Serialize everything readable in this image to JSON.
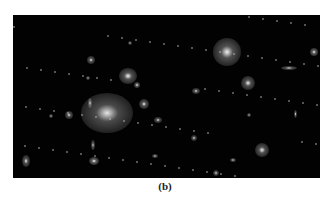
{
  "figure": {
    "caption": "(b)",
    "background_color": "#020202",
    "galaxies": [
      {
        "x": 94,
        "y": 98,
        "rx": 26,
        "ry": 20,
        "a": 0.55
      },
      {
        "x": 214,
        "y": 37,
        "rx": 14,
        "ry": 14,
        "a": 0.6
      },
      {
        "x": 115,
        "y": 61,
        "rx": 9,
        "ry": 8,
        "a": 0.6
      },
      {
        "x": 235,
        "y": 68,
        "rx": 7,
        "ry": 7,
        "a": 0.6
      },
      {
        "x": 249,
        "y": 135,
        "rx": 7,
        "ry": 7,
        "a": 0.6
      },
      {
        "x": 131,
        "y": 89,
        "rx": 5,
        "ry": 5,
        "a": 0.6
      },
      {
        "x": 124,
        "y": 70,
        "rx": 3,
        "ry": 3,
        "a": 0.7
      },
      {
        "x": 81,
        "y": 146,
        "rx": 5,
        "ry": 4,
        "a": 0.7
      },
      {
        "x": 13,
        "y": 146,
        "rx": 4,
        "ry": 6,
        "a": 0.6
      },
      {
        "x": 78,
        "y": 45,
        "rx": 4,
        "ry": 4,
        "a": 0.6
      },
      {
        "x": 56,
        "y": 100,
        "rx": 4,
        "ry": 4,
        "a": 0.6
      },
      {
        "x": 145,
        "y": 105,
        "rx": 4,
        "ry": 3,
        "a": 0.6
      },
      {
        "x": 276,
        "y": 53,
        "rx": 8,
        "ry": 2,
        "a": 0.6
      },
      {
        "x": 301,
        "y": 37,
        "rx": 4,
        "ry": 4,
        "a": 0.7
      },
      {
        "x": 183,
        "y": 76,
        "rx": 4,
        "ry": 3,
        "a": 0.6
      },
      {
        "x": 181,
        "y": 123,
        "rx": 3,
        "ry": 3,
        "a": 0.6
      },
      {
        "x": 203,
        "y": 158,
        "rx": 3,
        "ry": 3,
        "a": 0.6
      },
      {
        "x": 77,
        "y": 88,
        "rx": 2,
        "ry": 5,
        "a": 0.6
      },
      {
        "x": 80,
        "y": 130,
        "rx": 2,
        "ry": 5,
        "a": 0.6
      },
      {
        "x": 282,
        "y": 99,
        "rx": 1.5,
        "ry": 4,
        "a": 0.6
      },
      {
        "x": 142,
        "y": 141,
        "rx": 3,
        "ry": 2,
        "a": 0.6
      },
      {
        "x": 220,
        "y": 145,
        "rx": 3,
        "ry": 2,
        "a": 0.6
      },
      {
        "x": 236,
        "y": 100,
        "rx": 2,
        "ry": 2,
        "a": 0.6
      },
      {
        "x": 117,
        "y": 28,
        "rx": 2,
        "ry": 2,
        "a": 0.6
      },
      {
        "x": 75,
        "y": 63,
        "rx": 2,
        "ry": 2,
        "a": 0.6
      },
      {
        "x": 38,
        "y": 101,
        "rx": 2,
        "ry": 2,
        "a": 0.6
      }
    ]
  }
}
